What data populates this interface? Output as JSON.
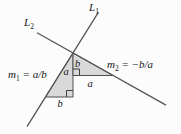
{
  "labels": {
    "l1": {
      "base": "L",
      "sub": "1"
    },
    "l2": {
      "base": "L",
      "sub": "2"
    },
    "m1": {
      "base": "m",
      "sub": "1",
      "rhs": " = a/b"
    },
    "m2": {
      "base": "m",
      "sub": "2",
      "rhs": " = −b/a"
    },
    "m2_rise": "b",
    "m1_rise": "a",
    "m2_run": "a",
    "m1_run": "b"
  },
  "colors": {
    "line": "#565656",
    "triangle_fill": "#d9d9d9",
    "text": "#161616",
    "background": "#fcfcfc"
  }
}
